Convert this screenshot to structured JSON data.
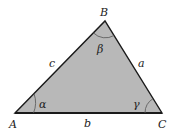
{
  "diagram": {
    "fill_color": "#b8b8b8",
    "stroke_color": "#1a1a1a",
    "vertices": {
      "A": {
        "label": "A",
        "x": 15,
        "y": 113
      },
      "B": {
        "label": "B",
        "x": 105,
        "y": 21
      },
      "C": {
        "label": "C",
        "x": 162,
        "y": 113
      }
    },
    "sides": {
      "a": {
        "label": "a",
        "between": "B-C"
      },
      "b": {
        "label": "b",
        "between": "A-C"
      },
      "c": {
        "label": "c",
        "between": "A-B"
      }
    },
    "angles": {
      "alpha": {
        "label": "α",
        "at": "A"
      },
      "beta": {
        "label": "β",
        "at": "B"
      },
      "gamma": {
        "label": "γ",
        "at": "C"
      }
    }
  }
}
